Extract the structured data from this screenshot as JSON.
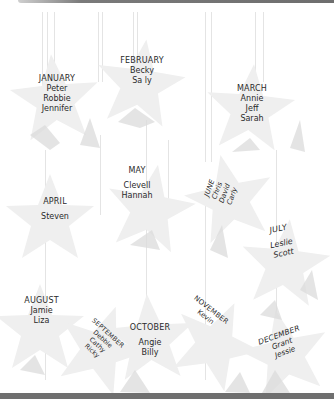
{
  "colors": {
    "star_fill": "#efefef",
    "star_shadow": "#dcdcdc",
    "string": "#e4e4e4",
    "rule": "#6f6f6f",
    "text": "#2a2a2a"
  },
  "months": [
    {
      "month": "JANUARY",
      "names": [
        "Peter",
        "Robbie",
        "Jennifer"
      ]
    },
    {
      "month": "FEBRUARY",
      "names": [
        "Becky",
        "Sa ly"
      ]
    },
    {
      "month": "MARCH",
      "names": [
        "Annie",
        "Jeff",
        "Sarah"
      ]
    },
    {
      "month": "APRIL",
      "names": [
        "Steven"
      ]
    },
    {
      "month": "MAY",
      "names": [
        "Clevell",
        "Hannah"
      ]
    },
    {
      "month": "JUNE",
      "names": [
        "Chris",
        "David",
        "Carly"
      ]
    },
    {
      "month": "JULY",
      "names": [
        "Leslie",
        "Scott"
      ]
    },
    {
      "month": "AUGUST",
      "names": [
        "Jamie",
        "Liza"
      ]
    },
    {
      "month": "SEPTEMBER",
      "names": [
        "Debbie",
        "Cathy",
        "Ricky"
      ]
    },
    {
      "month": "OCTOBER",
      "names": [
        "Angie",
        "Billy"
      ]
    },
    {
      "month": "NOVEMBER",
      "names": [
        "Kevin"
      ]
    },
    {
      "month": "DECEMBER",
      "names": [
        "Grant",
        "Jessie"
      ]
    }
  ]
}
